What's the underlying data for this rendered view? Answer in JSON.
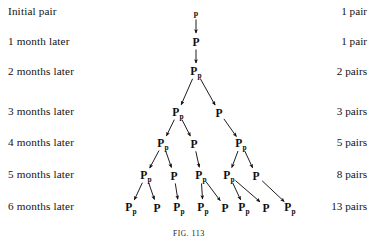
{
  "figure": {
    "caption_prefix": "FIG.",
    "caption_number": "113"
  },
  "rows": [
    {
      "label": "Initial pair",
      "count": "1 pair",
      "y": 12
    },
    {
      "label": "1 month later",
      "count": "1 pair",
      "y": 42
    },
    {
      "label": "2 months later",
      "count": "2 pairs",
      "y": 72
    },
    {
      "label": "3 months later",
      "count": "3 pairs",
      "y": 112
    },
    {
      "label": "4 months later",
      "count": "5 pairs",
      "y": 143
    },
    {
      "label": "5 months later",
      "count": "8 pairs",
      "y": 175
    },
    {
      "label": "6 months later",
      "count": "13 pairs",
      "y": 207
    }
  ],
  "tree": {
    "symbol_adult": "P",
    "symbol_baby": "p",
    "nodes": [
      {
        "id": "n0",
        "row": 0,
        "x": 196,
        "y": 11,
        "type": "baby",
        "label": "p"
      },
      {
        "id": "n1",
        "row": 1,
        "x": 196,
        "y": 41,
        "type": "adult",
        "label": "P"
      },
      {
        "id": "n2",
        "row": 2,
        "x": 196,
        "y": 71,
        "type": "pair",
        "label": "Pp"
      },
      {
        "id": "n3a",
        "row": 3,
        "x": 178,
        "y": 112,
        "type": "pair",
        "label": "Pp"
      },
      {
        "id": "n3b",
        "row": 3,
        "x": 219,
        "y": 112,
        "type": "adult",
        "label": "P"
      },
      {
        "id": "n4a",
        "row": 4,
        "x": 163,
        "y": 143,
        "type": "pair",
        "label": "Pp"
      },
      {
        "id": "n4b",
        "row": 4,
        "x": 194,
        "y": 143,
        "type": "adult",
        "label": "P"
      },
      {
        "id": "n4c",
        "row": 4,
        "x": 241,
        "y": 143,
        "type": "pair",
        "label": "Pp"
      },
      {
        "id": "n5a",
        "row": 5,
        "x": 146,
        "y": 175,
        "type": "pair",
        "label": "Pp"
      },
      {
        "id": "n5b",
        "row": 5,
        "x": 174,
        "y": 175,
        "type": "adult",
        "label": "P"
      },
      {
        "id": "n5c",
        "row": 5,
        "x": 201,
        "y": 175,
        "type": "pair",
        "label": "Pp"
      },
      {
        "id": "n5d",
        "row": 5,
        "x": 229,
        "y": 175,
        "type": "pair",
        "label": "Pp"
      },
      {
        "id": "n5e",
        "row": 5,
        "x": 256,
        "y": 175,
        "type": "adult",
        "label": "P"
      },
      {
        "id": "n6a",
        "row": 6,
        "x": 131,
        "y": 207,
        "type": "pair",
        "label": "Pp"
      },
      {
        "id": "n6b",
        "row": 6,
        "x": 157,
        "y": 207,
        "type": "adult",
        "label": "P"
      },
      {
        "id": "n6c",
        "row": 6,
        "x": 179,
        "y": 207,
        "type": "pair",
        "label": "Pp"
      },
      {
        "id": "n6d",
        "row": 6,
        "x": 203,
        "y": 207,
        "type": "pair",
        "label": "Pp"
      },
      {
        "id": "n6e",
        "row": 6,
        "x": 225,
        "y": 207,
        "type": "adult",
        "label": "P"
      },
      {
        "id": "n6f",
        "row": 6,
        "x": 244,
        "y": 207,
        "type": "pair",
        "label": "Pp"
      },
      {
        "id": "n6g",
        "row": 6,
        "x": 266,
        "y": 207,
        "type": "adult",
        "label": "P"
      },
      {
        "id": "n6h",
        "row": 6,
        "x": 290,
        "y": 207,
        "type": "pair",
        "label": "Pp"
      }
    ],
    "edges": [
      {
        "from": "n0",
        "to": "n1"
      },
      {
        "from": "n1",
        "to": "n2"
      },
      {
        "from": "n2",
        "to": "n3a"
      },
      {
        "from": "n2",
        "to": "n3b"
      },
      {
        "from": "n3a",
        "to": "n4a"
      },
      {
        "from": "n3a",
        "to": "n4b"
      },
      {
        "from": "n3b",
        "to": "n4c"
      },
      {
        "from": "n4a",
        "to": "n5a"
      },
      {
        "from": "n4a",
        "to": "n5b"
      },
      {
        "from": "n4b",
        "to": "n5c"
      },
      {
        "from": "n4c",
        "to": "n5d"
      },
      {
        "from": "n4c",
        "to": "n5e"
      },
      {
        "from": "n5a",
        "to": "n6a"
      },
      {
        "from": "n5a",
        "to": "n6b"
      },
      {
        "from": "n5b",
        "to": "n6c"
      },
      {
        "from": "n5c",
        "to": "n6d"
      },
      {
        "from": "n5c",
        "to": "n6e"
      },
      {
        "from": "n5d",
        "to": "n6f"
      },
      {
        "from": "n5d",
        "to": "n6g"
      },
      {
        "from": "n5e",
        "to": "n6h"
      }
    ]
  },
  "colors": {
    "ink": "#101010",
    "page": "#ffffff"
  }
}
